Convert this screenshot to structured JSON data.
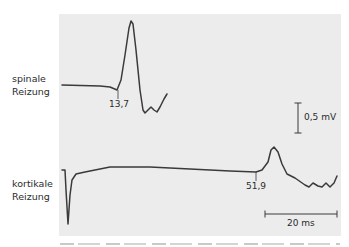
{
  "chart_data": {
    "type": "line",
    "title": "",
    "xlabel": "",
    "ylabel": "",
    "grid": false,
    "legend": "none",
    "series": [
      {
        "name": "spinale Reizung",
        "label_lines": [
          "spinale",
          "Reizung"
        ],
        "onset_marker": "13,7",
        "onset_ms": 13.7,
        "description": "Evoked potential: flat baseline, small negative dip at onset 13,7 ms, sharp large positive peak, then deflection below baseline with small oscillations",
        "points_px": [
          [
            62,
            85
          ],
          [
            100,
            86
          ],
          [
            110,
            87
          ],
          [
            117,
            90
          ],
          [
            121,
            80
          ],
          [
            125,
            55
          ],
          [
            129,
            28
          ],
          [
            131,
            21
          ],
          [
            133,
            24
          ],
          [
            136,
            50
          ],
          [
            140,
            90
          ],
          [
            143,
            110
          ],
          [
            145,
            113
          ],
          [
            148,
            110
          ],
          [
            151,
            107
          ],
          [
            154,
            110
          ],
          [
            157,
            112
          ],
          [
            160,
            107
          ],
          [
            164,
            99
          ],
          [
            167,
            94
          ]
        ]
      },
      {
        "name": "kortikale Reizung",
        "label_lines": [
          "kortikale",
          "Reizung"
        ],
        "onset_marker": "51,9",
        "onset_ms": 51.9,
        "description": "Stimulus artifact (sharp downward spike), long flat baseline, onset at 51,9 ms followed by moderate positive peak and small oscillations",
        "points_px": [
          [
            62,
            170
          ],
          [
            65,
            170
          ],
          [
            66,
            190
          ],
          [
            68,
            224
          ],
          [
            70,
            195
          ],
          [
            72,
            180
          ],
          [
            76,
            174
          ],
          [
            85,
            172
          ],
          [
            110,
            167
          ],
          [
            150,
            167
          ],
          [
            190,
            169
          ],
          [
            230,
            171
          ],
          [
            256,
            172
          ],
          [
            262,
            170
          ],
          [
            268,
            162
          ],
          [
            271,
            150
          ],
          [
            274,
            147
          ],
          [
            278,
            152
          ],
          [
            282,
            164
          ],
          [
            287,
            174
          ],
          [
            295,
            178
          ],
          [
            305,
            185
          ],
          [
            309,
            187
          ],
          [
            313,
            183
          ],
          [
            318,
            186
          ],
          [
            322,
            187
          ],
          [
            326,
            183
          ],
          [
            330,
            187
          ],
          [
            334,
            183
          ],
          [
            337,
            176
          ]
        ]
      }
    ],
    "scale_bars": {
      "amplitude": {
        "label": "0,5 mV",
        "value_mV": 0.5
      },
      "time": {
        "label": "20 ms",
        "value_ms": 20
      }
    }
  },
  "labels": {
    "spinal": [
      "spinale",
      "Reizung"
    ],
    "cortical": [
      "kortikale",
      "Reizung"
    ],
    "spinal_marker": "13,7",
    "cortical_marker": "51,9",
    "amplitude_scale": "0,5 mV",
    "time_scale": "20 ms"
  },
  "colors": {
    "panel_background": "#ececec",
    "trace": "#3a3a3a",
    "text": "#2b2b2b"
  }
}
